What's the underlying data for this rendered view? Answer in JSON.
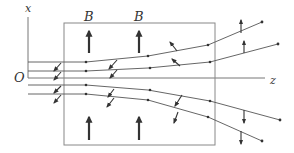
{
  "diagram": {
    "labels": {
      "x_axis": "x",
      "z_axis": "z",
      "origin": "O",
      "field_1": "B",
      "field_2": "B"
    },
    "colors": {
      "line": "#555555",
      "arrow": "#333333",
      "box": "#777777"
    },
    "field_region": {
      "left": 64,
      "top": 23,
      "right": 215,
      "bottom": 145
    },
    "field_arrows": [
      {
        "x": 89,
        "y_from": 53,
        "y_to": 30
      },
      {
        "x": 139,
        "y_from": 53,
        "y_to": 30
      },
      {
        "x": 89,
        "y_from": 140,
        "y_to": 116
      },
      {
        "x": 139,
        "y_from": 140,
        "y_to": 116
      }
    ],
    "beams": 4
  }
}
